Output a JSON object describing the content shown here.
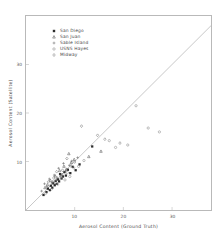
{
  "chart_data": {
    "type": "scatter",
    "title": "",
    "xlabel": "Aerosol Content (Ground Truth)",
    "ylabel": "Aerosol Content (Satellite)",
    "xlim": [
      0,
      38
    ],
    "ylim": [
      0,
      40
    ],
    "xticks": [
      10,
      20,
      30
    ],
    "xtick_labels": [
      "10",
      "20",
      "30"
    ],
    "yticks": [
      10,
      20,
      30
    ],
    "ytick_labels": [
      "10",
      "20",
      "30"
    ],
    "grid": false,
    "legend_position": "upper-left-inside",
    "reference_line": {
      "name": "one-to-one-line",
      "type": "diagonal",
      "slope": 1,
      "intercept": 0,
      "color": "#b0b0b0"
    },
    "series": [
      {
        "name": "San Diego",
        "marker": "square-filled",
        "color": "#2b2b2b",
        "points": [
          [
            3.6,
            3.1
          ],
          [
            4.2,
            3.7
          ],
          [
            4.5,
            4.4
          ],
          [
            4.9,
            4.1
          ],
          [
            5.1,
            5.0
          ],
          [
            5.4,
            4.6
          ],
          [
            5.6,
            5.5
          ],
          [
            5.9,
            5.1
          ],
          [
            6.1,
            6.0
          ],
          [
            6.3,
            5.4
          ],
          [
            6.6,
            6.3
          ],
          [
            6.8,
            5.9
          ],
          [
            7.0,
            7.4
          ],
          [
            7.3,
            6.5
          ],
          [
            7.6,
            6.9
          ],
          [
            7.9,
            7.8
          ],
          [
            8.2,
            7.1
          ],
          [
            8.6,
            8.3
          ],
          [
            9.1,
            7.6
          ],
          [
            9.6,
            8.9
          ],
          [
            10.2,
            8.2
          ],
          [
            11.0,
            9.4
          ],
          [
            13.6,
            13.1
          ]
        ]
      },
      {
        "name": "San Juan",
        "marker": "triangle",
        "color": "#555555",
        "points": [
          [
            3.9,
            4.6
          ],
          [
            4.4,
            5.2
          ],
          [
            5.0,
            6.1
          ],
          [
            5.5,
            5.8
          ],
          [
            6.0,
            7.0
          ],
          [
            6.4,
            6.6
          ],
          [
            6.9,
            8.1
          ],
          [
            7.4,
            7.3
          ],
          [
            7.8,
            9.0
          ],
          [
            8.3,
            8.4
          ],
          [
            8.8,
            11.6
          ],
          [
            9.3,
            9.8
          ],
          [
            9.9,
            10.4
          ],
          [
            12.9,
            11.0
          ],
          [
            15.4,
            12.1
          ]
        ]
      },
      {
        "name": "Sable Island",
        "marker": "plus",
        "color": "#6a6a6a",
        "points": [
          [
            3.2,
            3.9
          ],
          [
            3.8,
            5.4
          ],
          [
            4.3,
            4.8
          ],
          [
            4.8,
            6.4
          ],
          [
            5.3,
            5.6
          ],
          [
            5.8,
            7.2
          ],
          [
            6.2,
            6.1
          ],
          [
            6.7,
            8.6
          ],
          [
            7.1,
            7.0
          ],
          [
            7.7,
            9.6
          ],
          [
            8.1,
            8.0
          ],
          [
            8.9,
            9.2
          ],
          [
            9.4,
            10.1
          ],
          [
            10.6,
            10.8
          ]
        ]
      },
      {
        "name": "USNS Hayes",
        "marker": "circle-open",
        "color": "#8a8a8a",
        "points": [
          [
            4.0,
            3.4
          ],
          [
            5.2,
            4.3
          ],
          [
            6.5,
            5.3
          ],
          [
            7.2,
            6.8
          ],
          [
            8.0,
            6.2
          ],
          [
            8.5,
            7.7
          ],
          [
            9.0,
            6.9
          ],
          [
            9.8,
            8.7
          ],
          [
            10.8,
            9.0
          ],
          [
            11.9,
            10.2
          ],
          [
            17.1,
            14.3
          ],
          [
            18.4,
            12.9
          ],
          [
            20.9,
            13.4
          ],
          [
            22.6,
            21.5
          ],
          [
            25.1,
            16.9
          ],
          [
            27.4,
            16.1
          ]
        ]
      },
      {
        "name": "Midway",
        "marker": "diamond",
        "color": "#777777",
        "points": [
          [
            4.6,
            5.8
          ],
          [
            5.7,
            6.6
          ],
          [
            6.3,
            7.9
          ],
          [
            7.5,
            8.2
          ],
          [
            8.4,
            10.6
          ],
          [
            9.2,
            9.1
          ],
          [
            10.0,
            9.9
          ],
          [
            11.4,
            17.3
          ],
          [
            14.7,
            15.4
          ],
          [
            16.2,
            14.6
          ],
          [
            19.3,
            13.8
          ]
        ]
      }
    ]
  }
}
